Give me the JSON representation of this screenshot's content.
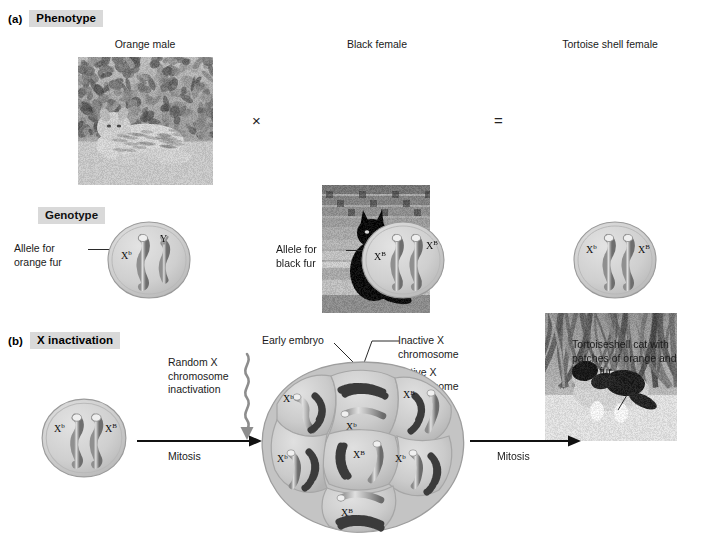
{
  "figure": {
    "sections": [
      {
        "tag": "(a)",
        "title": "Phenotype"
      },
      {
        "tag": "(b)",
        "title": "X inactivation"
      }
    ],
    "genotype_header": "Genotype"
  },
  "phenotype": {
    "parents": [
      {
        "caption": "Orange male",
        "photo": "orange-cat-photo"
      },
      {
        "caption": "Black female",
        "photo": "black-cat-photo"
      },
      {
        "caption": "Tortoise shell female",
        "photo": "tortoiseshell-cat-photo"
      }
    ],
    "operators": {
      "cross": "×",
      "equals": "="
    }
  },
  "genotype": {
    "annotations": [
      {
        "text": "Allele for\norange fur"
      },
      {
        "text": "Allele for\nblack fur"
      }
    ],
    "cells": [
      {
        "name": "male-genotype-cell",
        "left": "X",
        "left_sup": "b",
        "right": "Y",
        "right_sup": ""
      },
      {
        "name": "female-genotype-cell",
        "left": "X",
        "left_sup": "B",
        "right": "X",
        "right_sup": "B"
      },
      {
        "name": "tortoiseshell-genotype-cell",
        "left": "X",
        "left_sup": "b",
        "right": "X",
        "right_sup": "B"
      }
    ]
  },
  "inactivation": {
    "random_label": "Random X\nchromosome\ninactivation",
    "mitosis_label_left": "Mitosis",
    "mitosis_label_right": "Mitosis",
    "zygote_cell": {
      "left": "X",
      "left_sup": "b",
      "right": "X",
      "right_sup": "B"
    },
    "embryo_label": "Early embryo",
    "inactive_label": "Inactive X\nchromosome",
    "active_label": "Active X\nchromosome",
    "result_caption": "Tortoiseshell cat with\npatches of orange and\nblack fur.",
    "embryo_cells": [
      {
        "id": "cell-top",
        "active": "X",
        "active_sup": "b"
      },
      {
        "id": "cell-upper-left",
        "active": "X",
        "active_sup": "b"
      },
      {
        "id": "cell-upper-right",
        "active": "X",
        "active_sup": "B"
      },
      {
        "id": "cell-center",
        "active": "X",
        "active_sup": "B"
      },
      {
        "id": "cell-lower-left",
        "active": "X",
        "active_sup": "b"
      },
      {
        "id": "cell-lower-right",
        "active": "X",
        "active_sup": "b"
      },
      {
        "id": "cell-bottom",
        "active": "X",
        "active_sup": "B"
      }
    ]
  },
  "colors": {
    "header_highlight": "#d9d9d9",
    "cell_fill": "#c9c9c9",
    "chromosome_dark": "#4a4a4a",
    "line": "#2a2a2a"
  }
}
